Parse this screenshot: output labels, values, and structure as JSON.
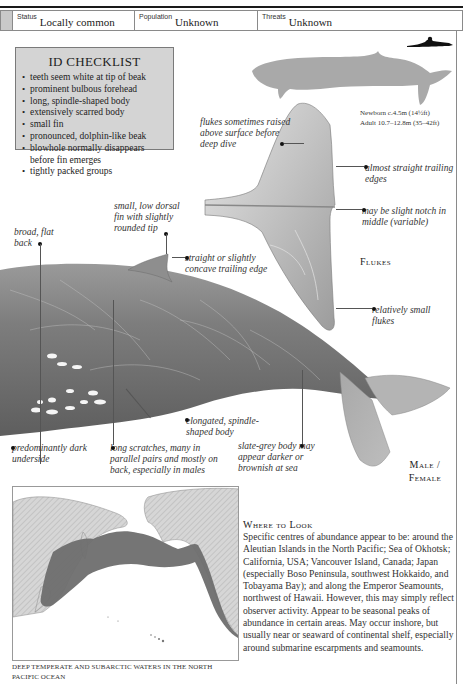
{
  "header": {
    "status_label": "Status",
    "status_value": "Locally common",
    "population_label": "Population",
    "population_value": "Unknown",
    "threats_label": "Threats",
    "threats_value": "Unknown"
  },
  "id_checklist": {
    "title": "ID CHECKLIST",
    "items": [
      "teeth seem white at tip of beak",
      "prominent bulbous forehead",
      "long, spindle-shaped body",
      "extensively scarred body",
      "small fin",
      "pronounced, dolphin-like beak",
      "blowhole normally disappears before fin emerges",
      "tightly packed groups"
    ]
  },
  "size": {
    "newborn": "Newborn c.4.5m (14½ft)",
    "adult": "Adult 10.7–12.8m (35–42ft)"
  },
  "flukes_panel": {
    "caption": "Flukes",
    "annotations": {
      "raised": "flukes sometimes raised above surface before deep dive",
      "straight_edges": "almost straight trailing edges",
      "notch": "may be slight notch in middle (variable)",
      "small": "relatively small flukes"
    }
  },
  "body_annotations": {
    "back": "broad, flat back",
    "dorsal_fin": "small, low dorsal fin with slightly rounded tip",
    "trailing_edge": "straight or slightly concave trailing edge",
    "underside": "predominantly dark underside",
    "scratches": "long scratches, many in parallel pairs and mostly on back, especially in males",
    "elongated": "elongated, spindle-shaped body",
    "colour": "slate-grey body may appear darker or brownish at sea"
  },
  "main_caption": "Male / Female",
  "map": {
    "caption": "DEEP TEMPERATE AND SUBARCTIC WATERS IN THE NORTH PACIFIC OCEAN",
    "range_color": "#6e6e6e",
    "land_color": "#c8c8c8"
  },
  "where_to_look": {
    "title": "Where to Look",
    "body": "Specific centres of abundance appear to be: around the Aleutian Islands in the North Pacific; Sea of Okhotsk; California, USA; Vancouver Island, Canada; Japan (especially Boso Peninsula, southwest Hokkaido, and Tobayama Bay); and along the Emperor Seamounts, northwest of Hawaii. However, this may simply reflect observer activity. Appear to be seasonal peaks of abundance in certain areas. May occur inshore, but usually near or seaward of continental shelf, especially around submarine escarpments and seamounts."
  }
}
